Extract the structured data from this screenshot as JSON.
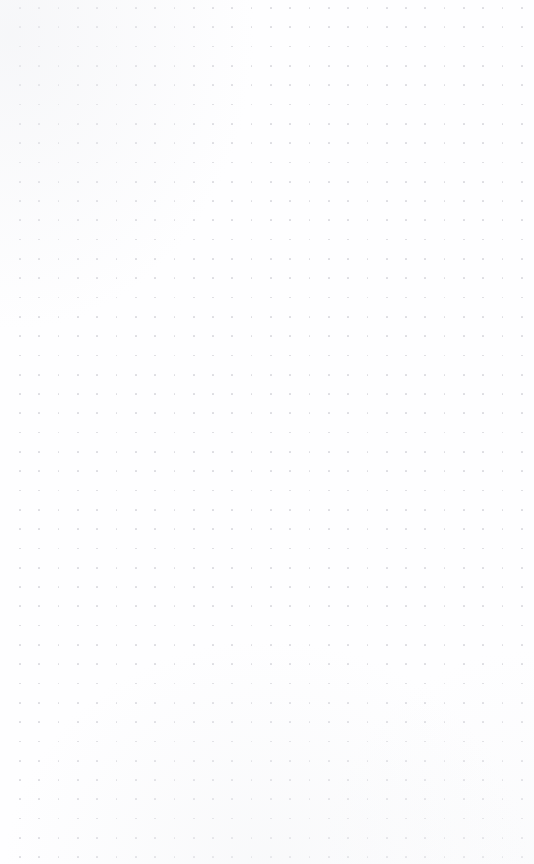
{
  "page": {
    "kind": "blank-dot-grid-page",
    "width": 534,
    "height": 864,
    "background_color": "#ffffff",
    "paper_color": "#fefeff"
  },
  "grid": {
    "pattern": "dot-grid",
    "dot_color": "#dbdbe0",
    "dot_diameter_px": 1.7,
    "spacing_x_px": 19.3,
    "spacing_y_px": 19.3,
    "origin_x_px": 20,
    "origin_y_px": 8,
    "columns": 27,
    "rows": 45,
    "margin_left_px": 20,
    "margin_right_px": 24,
    "margin_top_px": 8,
    "margin_bottom_px": 28
  },
  "content": {
    "has_text": false,
    "has_images": false,
    "has_controls": false,
    "note": ""
  }
}
